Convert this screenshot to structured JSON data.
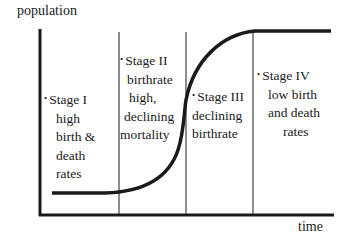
{
  "diagram": {
    "y_axis_label": "population",
    "x_axis_label": "time",
    "colors": {
      "line": "#1a1a1a",
      "background": "#ffffff"
    },
    "stages": [
      {
        "name": "Stage I",
        "lines": [
          "high",
          "birth &",
          "death",
          "rates"
        ]
      },
      {
        "name": "Stage II",
        "lines": [
          "birthrate",
          "high,",
          "declining",
          "mortality"
        ]
      },
      {
        "name": "Stage III",
        "lines": [
          "declining",
          "birthrate"
        ]
      },
      {
        "name": "Stage IV",
        "lines": [
          "low birth",
          "and death",
          "rates"
        ]
      }
    ]
  }
}
